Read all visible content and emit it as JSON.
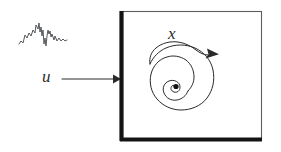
{
  "figure": {
    "background_color": "#ffffff",
    "ink_color": "#2a2a2a",
    "width": 281,
    "height": 152
  },
  "labels": {
    "input_signal": "u",
    "state_trajectory": "x"
  },
  "elements": {
    "waveform": {
      "name": "noisy input signal waveform",
      "stroke_color": "#55585c"
    },
    "input_arrow": {
      "name": "input arrow into plant",
      "stroke_color": "#2a2a2a",
      "direction": "right"
    },
    "plant_box": {
      "name": "system plant block",
      "thin_edge_color": "#5a5d61",
      "bold_edge_color": "#141414",
      "bold_edges": "left, bottom"
    },
    "trajectory": {
      "name": "state trajectory spiral",
      "stroke_color": "#2a2a2a",
      "origin_dot_color": "#111111",
      "arrow_direction": "up-right"
    }
  }
}
